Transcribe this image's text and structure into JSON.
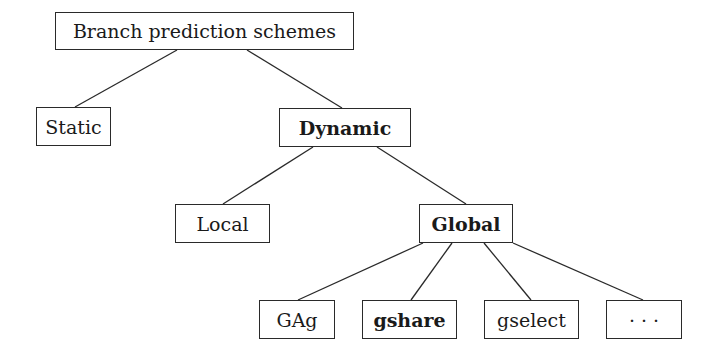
{
  "diagram": {
    "type": "tree",
    "nodes": [
      {
        "id": "root",
        "label": "Branch prediction schemes",
        "bold": false
      },
      {
        "id": "static",
        "label": "Static",
        "bold": false
      },
      {
        "id": "dynamic",
        "label": "Dynamic",
        "bold": true
      },
      {
        "id": "local",
        "label": "Local",
        "bold": false
      },
      {
        "id": "global",
        "label": "Global",
        "bold": true
      },
      {
        "id": "gag",
        "label": "GAg",
        "bold": false
      },
      {
        "id": "gshare",
        "label": "gshare",
        "bold": true
      },
      {
        "id": "gselect",
        "label": "gselect",
        "bold": false
      },
      {
        "id": "more",
        "label": "· · ·",
        "bold": false
      }
    ],
    "edges": [
      [
        "root",
        "static"
      ],
      [
        "root",
        "dynamic"
      ],
      [
        "dynamic",
        "local"
      ],
      [
        "dynamic",
        "global"
      ],
      [
        "global",
        "gag"
      ],
      [
        "global",
        "gshare"
      ],
      [
        "global",
        "gselect"
      ],
      [
        "global",
        "more"
      ]
    ]
  }
}
